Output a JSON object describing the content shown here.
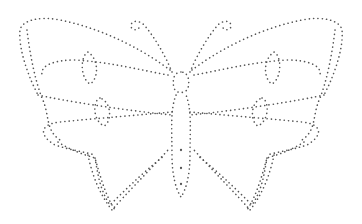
{
  "image": {
    "subject": "Dotted butterfly outline (tracing template)",
    "background": "#ffffff",
    "dot_color": "#555555",
    "dot_spacing": 4.2,
    "dot_size": 1.6
  },
  "shapes": {
    "left_forewing_outer": "M 170 70 C 150 55, 110 30, 60 20 C 40 16, 22 20, 20 30 C 18 50, 30 80, 38 95",
    "left_forewing_inner": "M 168 75 C 140 70, 110 62, 75 60 C 55 60, 40 65, 42 75",
    "left_forewing_bottom": "M 38 95 C 60 100, 120 110, 172 115",
    "left_inner_outer_edge": "M 27 30 C 30 55, 35 80, 42 98 C 50 115, 45 130, 60 140",
    "left_hindwing_top": "M 172 112 C 140 115, 100 118, 60 122 C 40 124, 38 135, 55 145 C 70 150, 85 152, 95 155",
    "left_hindwing_outer": "M 58 142 C 70 150, 85 155, 95 158 C 100 175, 105 195, 115 210",
    "left_hindwing_inner_curve": "M 95 158 C 98 175, 100 190, 110 205 C 120 195, 140 175, 165 155",
    "left_tail_line": "M 88 155 C 92 175, 100 195, 112 210 C 125 195, 145 175, 168 150",
    "right_forewing_outer": "M 192 70 C 212 55, 252 30, 302 20 C 322 16, 340 20, 342 30 C 344 50, 332 80, 324 95",
    "right_forewing_inner": "M 194 75 C 222 70, 252 62, 287 60 C 307 60, 322 65, 320 75",
    "right_forewing_bottom": "M 324 95 C 302 100, 242 110, 190 115",
    "right_inner_outer_edge": "M 335 30 C 332 55, 327 80, 320 98 C 312 115, 317 130, 302 140",
    "right_hindwing_top": "M 190 112 C 222 115, 262 118, 302 122 C 322 124, 324 135, 307 145 C 292 150, 277 152, 267 155",
    "right_hindwing_outer": "M 304 142 C 292 150, 277 155, 267 158 C 262 175, 257 195, 247 210",
    "right_hindwing_inner_curve": "M 267 158 C 264 175, 262 190, 252 205 C 242 195, 222 175, 197 155",
    "right_tail_line": "M 274 155 C 270 175, 262 195, 250 210 C 237 195, 217 175, 194 150",
    "left_forewing_spot": "M 88 52 C 80 56, 80 78, 90 84 C 98 80, 100 60, 88 52 Z",
    "left_hindwing_spot": "M 100 98 C 93 100, 92 120, 104 126 C 112 122, 112 102, 100 98 Z",
    "right_forewing_spot": "M 274 52 C 282 56, 282 78, 272 84 C 264 80, 262 60, 274 52 Z",
    "right_hindwing_spot": "M 262 98 C 269 100, 270 120, 258 126 C 250 122, 250 102, 262 98 Z",
    "body_upper": "M 181 72 C 174 72, 172 80, 174 88 C 176 94, 186 94, 188 88 C 190 80, 188 72, 181 72 Z",
    "body_lower": "M 176 95 C 170 110, 172 130, 172 155 C 172 175, 176 190, 181 197 C 186 190, 190 175, 190 155 C 190 130, 192 110, 186 95",
    "body_dots": [
      [
        181,
        150
      ],
      [
        181,
        168
      ],
      [
        181,
        184
      ]
    ],
    "antenna_left": "M 172 72 C 165 55, 155 38, 145 26 C 140 20, 132 20, 131 25 C 130 30, 138 32, 140 26",
    "antenna_right": "M 190 72 C 197 55, 207 38, 217 26 C 222 20, 230 20, 231 25 C 232 30, 224 32, 222 26"
  },
  "labels": {
    "alt": "Butterfly dot-to-dot tracing outline"
  }
}
